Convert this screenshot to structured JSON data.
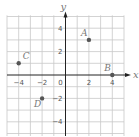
{
  "chart_data": {
    "type": "scatter",
    "title": "",
    "xlabel": "x",
    "ylabel": "y",
    "xlim": [
      -5,
      5
    ],
    "ylim": [
      -5,
      5
    ],
    "grid": true,
    "x_ticks": [
      -4,
      -2,
      0,
      2,
      4
    ],
    "y_ticks": [
      4,
      2,
      -2,
      -4
    ],
    "x_tick_labels": [
      "−4",
      "−2",
      "0",
      "2",
      "4"
    ],
    "y_tick_labels": [
      "4",
      "2",
      "−2",
      "−4"
    ],
    "points": [
      {
        "label": "A",
        "x": 2,
        "y": 3
      },
      {
        "label": "B",
        "x": 4,
        "y": 0
      },
      {
        "label": "C",
        "x": -4,
        "y": 1
      },
      {
        "label": "D",
        "x": -2,
        "y": -2
      }
    ]
  },
  "colors": {
    "grid": "#c8c8c8",
    "axis": "#222222",
    "point": "#555555",
    "label": "#777777",
    "tick_text": "#555555"
  }
}
